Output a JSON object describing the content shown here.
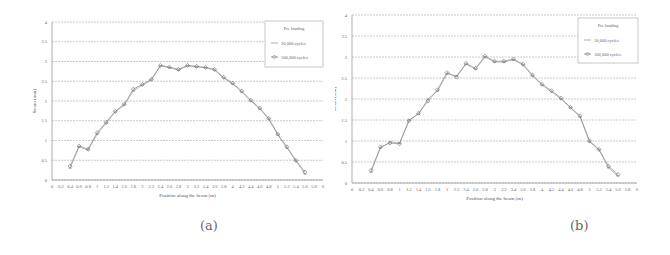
{
  "chart_data": [
    {
      "id": "a",
      "type": "line",
      "caption": "(a)",
      "title": "",
      "xlabel": "Position along the beam (m)",
      "ylabel": "Strain (mm)",
      "xlim": [
        0,
        6
      ],
      "ylim": [
        0,
        4
      ],
      "grid": true,
      "legend_position": "top-right",
      "x_ticks": [
        "0",
        "0.2",
        "0.4",
        "0.6",
        "0.8",
        "1",
        "1.2",
        "1.4",
        "1.6",
        "1.8",
        "2",
        "2.2",
        "2.4",
        "2.6",
        "2.8",
        "3",
        "3.2",
        "3.4",
        "3.6",
        "3.8",
        "4",
        "4.2",
        "4.4",
        "4.6",
        "4.8",
        "5",
        "5.2",
        "5.4",
        "5.6",
        "5.8",
        "6"
      ],
      "y_ticks": [
        "0",
        "0.5",
        "1",
        "1.5",
        "2",
        "2.5",
        "3",
        "3.5",
        "4"
      ],
      "legend": [
        "Pre loading",
        "10,000 cycles",
        "100,000 cycles"
      ],
      "x": [
        0.4,
        0.6,
        0.8,
        1.0,
        1.2,
        1.4,
        1.6,
        1.8,
        2.0,
        2.2,
        2.4,
        2.6,
        2.8,
        3.0,
        3.2,
        3.4,
        3.6,
        3.8,
        4.0,
        4.2,
        4.4,
        4.6,
        4.8,
        5.0,
        5.2,
        5.4,
        5.6
      ],
      "series": [
        {
          "name": "10,000 cycles",
          "color": "#8a8a8a",
          "values": [
            0.3,
            0.84,
            0.76,
            1.16,
            1.44,
            1.72,
            1.9,
            2.25,
            2.4,
            2.53,
            2.89,
            2.84,
            2.78,
            2.89,
            2.86,
            2.84,
            2.78,
            2.58,
            2.43,
            2.23,
            2.0,
            1.8,
            1.54,
            1.14,
            0.81,
            0.48,
            0.15
          ]
        },
        {
          "name": "100,000 cycles",
          "color": "#6f6f6f",
          "values": [
            0.35,
            0.86,
            0.78,
            1.2,
            1.46,
            1.74,
            1.92,
            2.3,
            2.42,
            2.55,
            2.9,
            2.86,
            2.8,
            2.9,
            2.88,
            2.85,
            2.8,
            2.6,
            2.45,
            2.25,
            2.02,
            1.82,
            1.56,
            1.16,
            0.84,
            0.5,
            0.2
          ]
        }
      ]
    },
    {
      "id": "b",
      "type": "line",
      "caption": "(b)",
      "title": "",
      "xlabel": "Position along the beam (m)",
      "ylabel": "Strain (mm)",
      "xlim": [
        0,
        6
      ],
      "ylim": [
        0,
        4
      ],
      "grid": true,
      "legend_position": "top-right",
      "x_ticks": [
        "0",
        "0.2",
        "0.4",
        "0.6",
        "0.8",
        "1",
        "1.2",
        "1.4",
        "1.6",
        "1.8",
        "2",
        "2.2",
        "2.4",
        "2.6",
        "2.8",
        "3",
        "3.2",
        "3.4",
        "3.6",
        "3.8",
        "4",
        "4.2",
        "4.4",
        "4.6",
        "4.8",
        "5",
        "5.2",
        "5.4",
        "5.6",
        "5.8",
        "6"
      ],
      "y_ticks": [
        "0",
        "0.5",
        "1",
        "1.5",
        "2",
        "2.5",
        "3",
        "3.5",
        "4"
      ],
      "legend": [
        "Pre loading",
        "10,000 cycles",
        "100,000 cycles"
      ],
      "x": [
        0.4,
        0.6,
        0.8,
        1.0,
        1.2,
        1.4,
        1.6,
        1.8,
        2.0,
        2.2,
        2.4,
        2.6,
        2.8,
        3.0,
        3.2,
        3.4,
        3.6,
        3.8,
        4.0,
        4.2,
        4.4,
        4.6,
        4.8,
        5.0,
        5.2,
        5.4,
        5.6
      ],
      "series": [
        {
          "name": "10,000 cycles",
          "color": "#8a8a8a",
          "values": [
            0.26,
            0.83,
            0.98,
            0.95,
            1.5,
            1.64,
            2.0,
            2.19,
            2.6,
            2.55,
            2.83,
            2.71,
            3.0,
            2.88,
            2.88,
            2.93,
            2.81,
            2.55,
            2.33,
            2.17,
            2.0,
            1.79,
            1.57,
            0.98,
            0.79,
            0.36,
            0.17
          ]
        },
        {
          "name": "100,000 cycles",
          "color": "#6f6f6f",
          "values": [
            0.3,
            0.86,
            0.95,
            0.93,
            1.48,
            1.66,
            1.95,
            2.22,
            2.63,
            2.52,
            2.85,
            2.73,
            3.02,
            2.9,
            2.9,
            2.95,
            2.83,
            2.57,
            2.35,
            2.2,
            2.02,
            1.8,
            1.6,
            1.0,
            0.8,
            0.4,
            0.2
          ]
        }
      ]
    }
  ],
  "panels": {
    "a": {
      "caption": "(a)"
    },
    "b": {
      "caption": "(b)"
    }
  }
}
